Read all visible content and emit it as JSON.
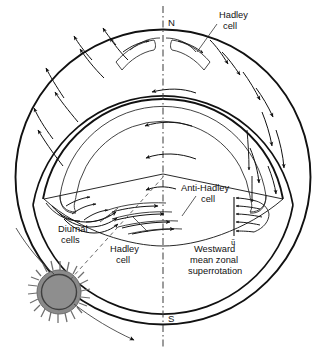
{
  "figure": {
    "kind": "schematic-diagram",
    "background_color": "#ffffff",
    "ink_color": "#111111"
  },
  "poles": {
    "north_label": "N",
    "south_label": "S"
  },
  "labels": {
    "hadley_cell_top": {
      "line1": "Hadley",
      "line2": "cell"
    },
    "anti_hadley_cell": {
      "line1": "Anti-Hadley",
      "line2": "cell"
    },
    "diurnal_cells": {
      "line1": "Diurnal",
      "line2": "cells"
    },
    "hadley_cell_lower": {
      "line1": "Hadley",
      "line2": "cell"
    },
    "superrotation": {
      "line1": "Westward",
      "line2": "mean zonal",
      "line3": "superrotation"
    },
    "zonal_wind_symbol": "ū"
  },
  "icons": {
    "sun": "sun-icon",
    "rotation_axis": "rotation-axis-dash-dot",
    "solar_beam": "solar-beam-arrow-icon"
  },
  "colors": {
    "sun_fill": "#8a8a8a",
    "sun_ring": "#4a4a4a",
    "sun_rays": "#6e6e6e",
    "line": "#111111",
    "thin_line": "#333333"
  }
}
